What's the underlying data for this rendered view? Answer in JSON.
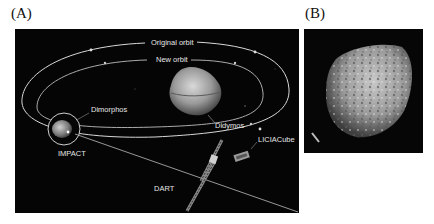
{
  "figure": {
    "panels": [
      {
        "label": "(A)",
        "description": "DART mission schematic",
        "annotations": {
          "original_orbit": "Original orbit",
          "new_orbit": "New orbit",
          "dimorphos": "Dimorphos",
          "didymos": "Didymos",
          "impact": "IMPACT",
          "dart": "DART",
          "liciacube": "LICIACube"
        }
      },
      {
        "label": "(B)",
        "description": "Close-up image of Dimorphos asteroid"
      }
    ],
    "colors": {
      "background": "#ffffff",
      "panel_background": "#050505",
      "orbit_line": "#d8d8d8",
      "text": "#e6e6e6"
    }
  }
}
